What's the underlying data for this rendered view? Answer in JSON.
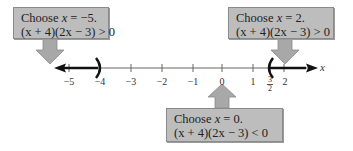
{
  "callouts": [
    {
      "id": "test-left",
      "line1_prefix": "Choose ",
      "line1_var": "x",
      "line1_suffix": " = −5.",
      "line2": "(x + 4)(2x − 3) > 0"
    },
    {
      "id": "test-right",
      "line1_prefix": "Choose ",
      "line1_var": "x",
      "line1_suffix": " = 2.",
      "line2": "(x + 4)(2x − 3) > 0"
    },
    {
      "id": "test-middle",
      "line1_prefix": "Choose ",
      "line1_var": "x",
      "line1_suffix": " = 0.",
      "line2": "(x + 4)(2x − 3) < 0"
    }
  ],
  "number_line": {
    "variable": "x",
    "ticks": [
      "−5",
      "−4",
      "−3",
      "−2",
      "−1",
      "0",
      "1",
      "2"
    ],
    "fraction_tick": {
      "numerator": "3",
      "denominator": "2"
    },
    "open_endpoints": [
      "−4",
      "3/2"
    ],
    "shaded_intervals": [
      "(−∞, −4)",
      "(3/2, ∞)"
    ]
  },
  "colors": {
    "callout_fill": "#bdbdbd",
    "arrow_fill": "#a8a8a8",
    "axis": "#555555",
    "shaded": "#111111"
  }
}
